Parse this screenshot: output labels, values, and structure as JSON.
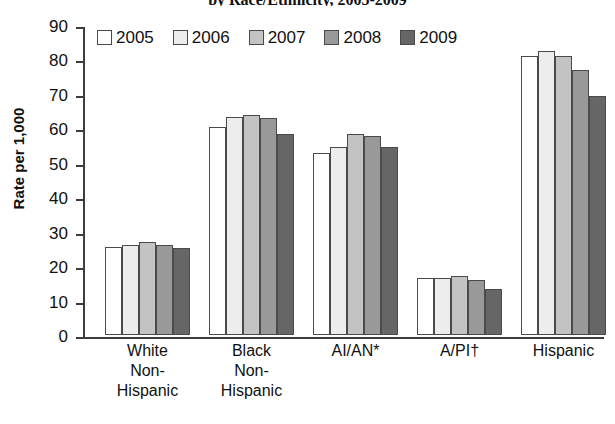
{
  "chart_data": {
    "type": "bar",
    "title": "by Race/Ethnicity, 2005-2009",
    "xlabel": "",
    "ylabel": "Rate per 1,000",
    "ylim": [
      0,
      90
    ],
    "ytick_step": 10,
    "yticks": [
      "90",
      "80",
      "70",
      "60",
      "50",
      "40",
      "30",
      "20",
      "10",
      "0"
    ],
    "grid": false,
    "legend_position": "top-left-inside",
    "categories": [
      "White\nNon-\nHispanic",
      "Black\nNon-\nHispanic",
      "AI/AN*",
      "A/PI†",
      "Hispanic"
    ],
    "series": [
      {
        "name": "2005",
        "color": "#ffffff",
        "values": [
          25.5,
          60.5,
          52.8,
          16.5,
          81.0
        ]
      },
      {
        "name": "2006",
        "color": "#ededed",
        "values": [
          26.0,
          63.4,
          54.7,
          16.6,
          82.5
        ]
      },
      {
        "name": "2007",
        "color": "#c3c3c3",
        "values": [
          27.0,
          64.0,
          58.4,
          17.1,
          81.0
        ]
      },
      {
        "name": "2008",
        "color": "#999999",
        "values": [
          26.0,
          63.0,
          57.8,
          16.0,
          77.0
        ]
      },
      {
        "name": "2009",
        "color": "#666666",
        "values": [
          25.2,
          58.4,
          54.7,
          13.5,
          69.5
        ]
      }
    ]
  },
  "legend": {
    "items": [
      {
        "label": "2005",
        "color": "#ffffff"
      },
      {
        "label": "2006",
        "color": "#ededed"
      },
      {
        "label": "2007",
        "color": "#c3c3c3"
      },
      {
        "label": "2008",
        "color": "#999999"
      },
      {
        "label": "2009",
        "color": "#666666"
      }
    ]
  },
  "axis": {
    "y_title": "Rate per 1,000"
  }
}
